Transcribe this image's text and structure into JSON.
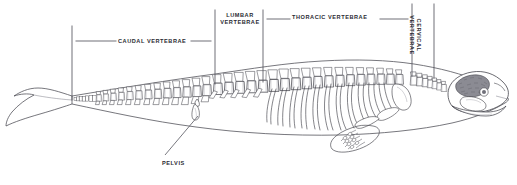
{
  "figure": {
    "width": 517,
    "height": 185,
    "background_color": "#ffffff",
    "ink_color": "#3a3a42",
    "label_color": "#2b2b33"
  },
  "labels": {
    "caudal": "CAUDAL VERTEBRAE",
    "lumbar_line1": "LUMBAR",
    "lumbar_line2": "VERTEBRAE",
    "thoracic": "THORACIC VERTEBRAE",
    "cervical_line1": "CERVICAL",
    "cervical_line2": "VERTEBRAE",
    "pelvis": "PELVIS"
  },
  "regions": [
    {
      "id": "caudal",
      "label": "CAUDAL VERTEBRAE",
      "bracket_left_x": 72,
      "bracket_right_x": 215,
      "bracket_top_y": 26,
      "bracket_bottom_y": 100,
      "orientation": "horizontal"
    },
    {
      "id": "lumbar",
      "label": "LUMBAR VERTEBRAE",
      "bracket_left_x": 215,
      "bracket_right_x": 263,
      "bracket_top_y": 10,
      "bracket_bottom_y": 84,
      "orientation": "horizontal"
    },
    {
      "id": "thoracic",
      "label": "THORACIC VERTEBRAE",
      "bracket_left_x": 263,
      "bracket_right_x": 412,
      "bracket_top_y": 10,
      "bracket_bottom_y": 78,
      "orientation": "horizontal"
    },
    {
      "id": "cervical",
      "label": "CERVICAL VERTEBRAE",
      "bracket_left_x": 412,
      "bracket_right_x": 434,
      "bracket_top_y": 4,
      "bracket_bottom_y": 74,
      "orientation": "vertical"
    }
  ],
  "callouts": [
    {
      "id": "pelvis",
      "label": "PELVIS",
      "leader_from_x": 199,
      "leader_from_y": 118,
      "leader_to_x": 164,
      "leader_to_y": 156
    }
  ],
  "anatomy_parts": [
    "tail-fluke",
    "caudal-vertebrae",
    "chevron-bones",
    "pelvis-bone",
    "lumbar-vertebrae",
    "thoracic-vertebrae",
    "ribs",
    "pectoral-flipper",
    "scapula",
    "cervical-vertebrae",
    "skull",
    "mandible",
    "body-outline"
  ]
}
